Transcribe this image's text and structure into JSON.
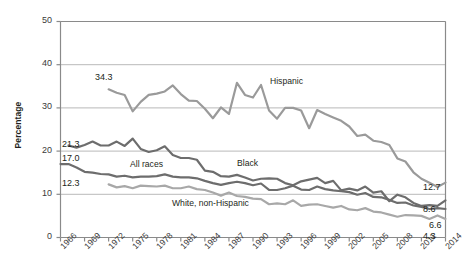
{
  "chart_data": {
    "type": "line",
    "title": "",
    "xlabel": "",
    "ylabel": "Percentage",
    "ylim": [
      0,
      50
    ],
    "xlim": [
      1966,
      2014
    ],
    "yticks": [
      0,
      10,
      20,
      30,
      40,
      50
    ],
    "xticks": [
      1966,
      1969,
      1972,
      1975,
      1978,
      1981,
      1984,
      1987,
      1990,
      1993,
      1996,
      1999,
      2002,
      2005,
      2008,
      2011,
      2014
    ],
    "grid": "horizontal",
    "legend_position": "inline-annotations",
    "x": [
      1966,
      1967,
      1968,
      1969,
      1970,
      1971,
      1972,
      1973,
      1974,
      1975,
      1976,
      1977,
      1978,
      1979,
      1980,
      1981,
      1982,
      1983,
      1984,
      1985,
      1986,
      1987,
      1988,
      1989,
      1990,
      1991,
      1992,
      1993,
      1994,
      1995,
      1996,
      1997,
      1998,
      1999,
      2000,
      2001,
      2002,
      2003,
      2004,
      2005,
      2006,
      2007,
      2008,
      2009,
      2010,
      2011,
      2012,
      2013,
      2014
    ],
    "series": [
      {
        "name": "Hispanic",
        "color": "#9a9a9a",
        "start_value": 34.3,
        "start_year": 1972,
        "end_value": 12.7,
        "values": [
          null,
          null,
          null,
          null,
          null,
          null,
          34.3,
          33.5,
          33.0,
          29.2,
          31.4,
          33.0,
          33.3,
          33.8,
          35.2,
          33.2,
          31.7,
          31.6,
          29.8,
          27.6,
          30.1,
          28.6,
          35.8,
          33.0,
          32.4,
          35.3,
          29.4,
          27.5,
          30.0,
          30.0,
          29.4,
          25.3,
          29.5,
          28.6,
          27.8,
          27.0,
          25.7,
          23.5,
          23.8,
          22.4,
          22.1,
          21.4,
          18.3,
          17.6,
          15.1,
          13.6,
          12.7,
          11.7,
          12.7
        ]
      },
      {
        "name": "Black",
        "color": "#6d6d6d",
        "start_value": 21.3,
        "start_year": 1967,
        "end_value": 8.6,
        "values": [
          null,
          21.3,
          20.8,
          21.4,
          22.2,
          21.3,
          21.3,
          22.2,
          21.2,
          22.9,
          20.5,
          19.8,
          20.2,
          21.1,
          19.1,
          18.4,
          18.4,
          18.0,
          15.5,
          15.2,
          14.2,
          14.1,
          14.5,
          13.9,
          13.2,
          13.6,
          13.7,
          13.6,
          12.6,
          12.1,
          13.0,
          13.4,
          13.8,
          12.6,
          13.1,
          10.9,
          11.3,
          10.9,
          11.8,
          10.4,
          10.7,
          8.4,
          9.9,
          9.3,
          8.0,
          7.3,
          7.5,
          7.3,
          8.6
        ]
      },
      {
        "name": "All races",
        "color": "#6d6d6d",
        "start_value": 17.0,
        "start_year": 1966,
        "end_value": 6.6,
        "values": [
          17.0,
          17.0,
          16.2,
          15.2,
          15.0,
          14.7,
          14.6,
          14.1,
          14.3,
          13.9,
          14.1,
          14.1,
          14.2,
          14.6,
          14.1,
          13.9,
          13.9,
          13.7,
          13.1,
          12.6,
          12.2,
          12.6,
          12.9,
          12.6,
          12.1,
          12.5,
          11.0,
          11.0,
          11.4,
          12.0,
          11.1,
          11.0,
          11.8,
          11.2,
          10.9,
          10.7,
          10.5,
          9.9,
          10.3,
          9.4,
          9.3,
          8.7,
          8.0,
          8.1,
          7.4,
          7.1,
          6.6,
          6.8,
          6.6
        ]
      },
      {
        "name": "White, non-Hispanic",
        "color": "#a8a8a8",
        "start_value": 12.3,
        "start_year": 1972,
        "end_value": 4.3,
        "values": [
          null,
          null,
          null,
          null,
          null,
          null,
          12.3,
          11.6,
          11.9,
          11.4,
          12.0,
          11.9,
          11.8,
          12.0,
          11.4,
          11.4,
          11.8,
          11.2,
          11.0,
          10.4,
          9.7,
          10.4,
          9.6,
          9.4,
          9.0,
          8.9,
          7.7,
          7.9,
          7.7,
          8.6,
          7.3,
          7.6,
          7.7,
          7.3,
          6.9,
          7.3,
          6.5,
          6.3,
          6.8,
          6.0,
          5.8,
          5.3,
          4.8,
          5.2,
          5.1,
          5.0,
          4.3,
          5.1,
          4.3
        ]
      }
    ],
    "start_labels": [
      {
        "text": "34.3",
        "series": "Hispanic"
      },
      {
        "text": "21.3",
        "series": "Black"
      },
      {
        "text": "17.0",
        "series": "All races"
      },
      {
        "text": "12.3",
        "series": "White, non-Hispanic"
      }
    ],
    "end_labels": [
      {
        "text": "12.7",
        "series": "Hispanic"
      },
      {
        "text": "8.6",
        "series": "Black"
      },
      {
        "text": "6.6",
        "series": "All races"
      },
      {
        "text": "4.3",
        "series": "White, non-Hispanic"
      }
    ],
    "inline_labels": [
      {
        "text": "Hispanic"
      },
      {
        "text": "Black"
      },
      {
        "text": "All races"
      },
      {
        "text": "White, non-Hispanic"
      }
    ]
  },
  "axis": {
    "y_title": "Percentage",
    "y_tick_labels": [
      "50",
      "40",
      "30",
      "20",
      "10",
      "0"
    ],
    "x_tick_labels": [
      "1966",
      "1969",
      "1972",
      "1975",
      "1978",
      "1981",
      "1984",
      "1987",
      "1990",
      "1993",
      "1996",
      "1999",
      "2002",
      "2005",
      "2008",
      "2011",
      "2014"
    ]
  },
  "annotations": {
    "hispanic": "Hispanic",
    "black": "Black",
    "all_races": "All races",
    "white_non_hispanic": "White, non-Hispanic",
    "start_hispanic": "34.3",
    "start_black": "21.3",
    "start_all_races": "17.0",
    "start_white": "12.3",
    "end_hispanic": "12.7",
    "end_black": "8.6",
    "end_all_races": "6.6",
    "end_white": "4.3"
  },
  "colors": {
    "hispanic": "#9a9a9a",
    "black": "#6d6d6d",
    "all_races": "#6d6d6d",
    "white_non_hispanic": "#a8a8a8",
    "grid": "#b9b9b9",
    "axis": "#8a8a8a",
    "text": "#3a3a3a"
  }
}
